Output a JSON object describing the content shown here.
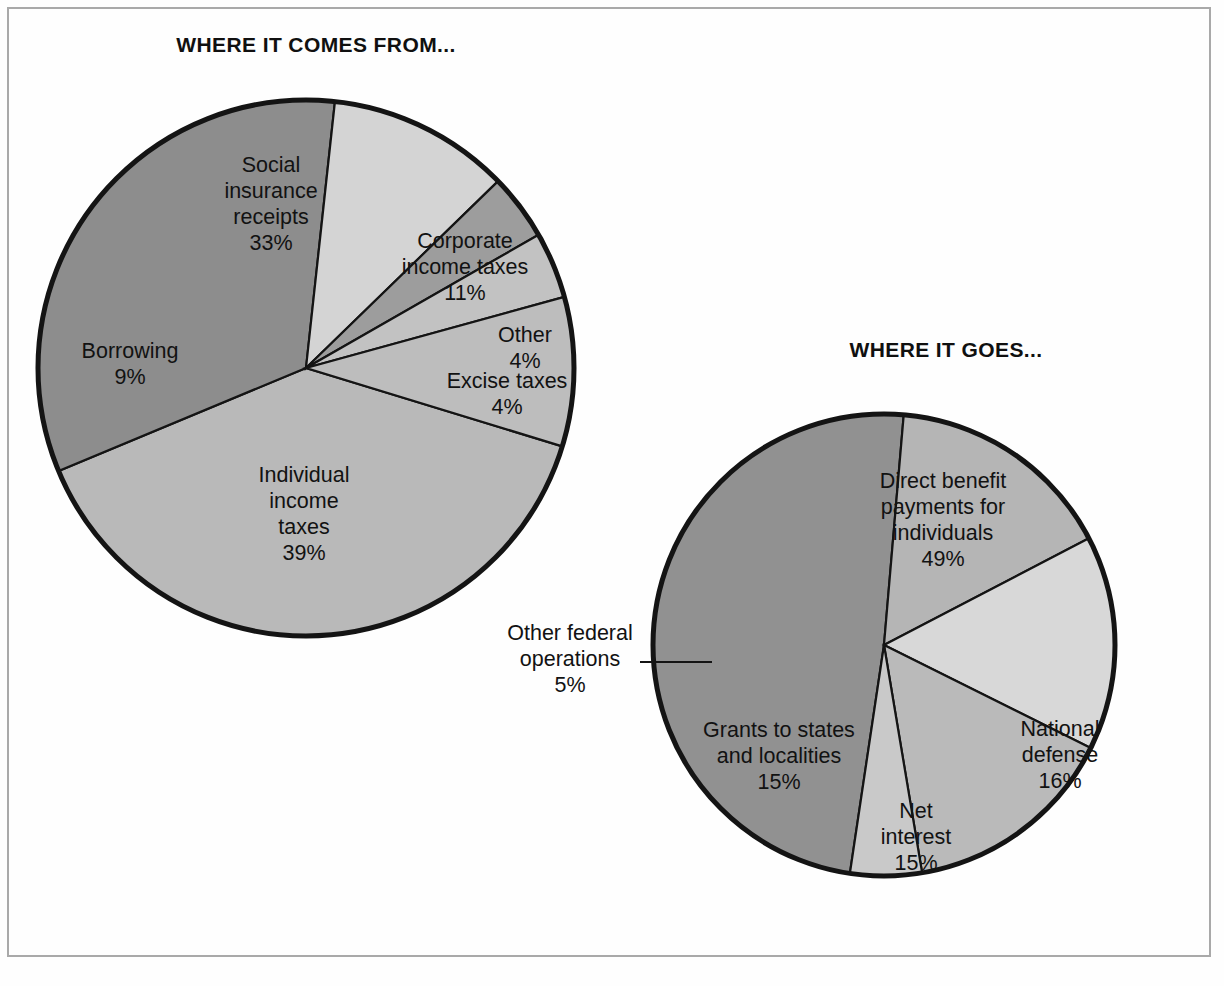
{
  "page": {
    "background_color": "#fefefe",
    "frame_color": "#a9a9a9"
  },
  "charts": {
    "left": {
      "title": "WHERE IT COMES FROM...",
      "center": {
        "x": 306,
        "y": 368
      },
      "radius": 268
    },
    "right": {
      "title": "WHERE IT GOES...",
      "center": {
        "x": 884,
        "y": 645
      },
      "radius": 231
    }
  },
  "chart_data": [
    {
      "type": "pie",
      "title": "WHERE IT COMES FROM...",
      "unit": "percent",
      "total": 100,
      "legend": "labels placed inside slices",
      "slices": [
        {
          "label": "Individual income taxes",
          "label_lines": [
            "Individual",
            "income",
            "taxes"
          ],
          "value": 39,
          "value_text": "39%",
          "color": "#b9b9b9",
          "start_angle": 107,
          "end_angle": 247.4,
          "label_x": 304,
          "label_y": 482
        },
        {
          "label": "Social insurance receipts",
          "label_lines": [
            "Social",
            "insurance",
            "receipts"
          ],
          "value": 33,
          "value_text": "33%",
          "color": "#8d8d8d",
          "start_angle": 247.4,
          "end_angle": 366.2,
          "label_x": 271,
          "label_y": 172
        },
        {
          "label": "Corporate income taxes",
          "label_lines": [
            "Corporate",
            "income taxes"
          ],
          "value": 11,
          "value_text": "11%",
          "color": "#d4d4d4",
          "start_angle": 6.2,
          "end_angle": 45.8,
          "label_x": 465,
          "label_y": 248
        },
        {
          "label": "Other",
          "label_lines": [
            "Other"
          ],
          "value": 4,
          "value_text": "4%",
          "color": "#9d9d9d",
          "start_angle": 45.8,
          "end_angle": 60.2,
          "label_x": 525,
          "label_y": 342
        },
        {
          "label": "Excise taxes",
          "label_lines": [
            "Excise taxes"
          ],
          "value": 4,
          "value_text": "4%",
          "color": "#c2c2c2",
          "start_angle": 60.2,
          "end_angle": 74.6,
          "label_x": 507,
          "label_y": 388
        },
        {
          "label": "Borrowing",
          "label_lines": [
            "Borrowing"
          ],
          "value": 9,
          "value_text": "9%",
          "color": "#bdbdbd",
          "start_angle": 74.6,
          "end_angle": 107,
          "label_x": 130,
          "label_y": 358
        }
      ]
    },
    {
      "type": "pie",
      "title": "WHERE IT GOES...",
      "unit": "percent",
      "total": 100,
      "legend": "labels placed inside slices; 'Other federal operations' uses an external leader line",
      "slices": [
        {
          "label": "Direct benefit payments for individuals",
          "label_lines": [
            "Direct benefit",
            "payments for",
            "individuals"
          ],
          "value": 49,
          "value_text": "49%",
          "color": "#919191",
          "start_angle": 188.5,
          "end_angle": 364.9,
          "label_x": 943,
          "label_y": 488
        },
        {
          "label": "National defense",
          "label_lines": [
            "National",
            "defense"
          ],
          "value": 16,
          "value_text": "16%",
          "color": "#b5b5b5",
          "start_angle": 4.9,
          "end_angle": 62.5,
          "label_x": 1060,
          "label_y": 736
        },
        {
          "label": "Net interest",
          "label_lines": [
            "Net",
            "interest"
          ],
          "value": 15,
          "value_text": "15%",
          "color": "#d8d8d8",
          "start_angle": 62.5,
          "end_angle": 116.5,
          "label_x": 916,
          "label_y": 818
        },
        {
          "label": "Grants to states and localities",
          "label_lines": [
            "Grants to states",
            "and localities"
          ],
          "value": 15,
          "value_text": "15%",
          "color": "#bababa",
          "start_angle": 116.5,
          "end_angle": 170.5,
          "label_x": 779,
          "label_y": 737
        },
        {
          "label": "Other federal operations",
          "label_lines": [
            "Other federal",
            "operations"
          ],
          "value": 5,
          "value_text": "5%",
          "color": "#c9c9c9",
          "start_angle": 170.5,
          "end_angle": 188.5,
          "label_x": 570,
          "label_y": 640,
          "external": true,
          "leader": {
            "x1": 640,
            "y1": 662,
            "x2": 712,
            "y2": 662
          }
        }
      ]
    }
  ]
}
